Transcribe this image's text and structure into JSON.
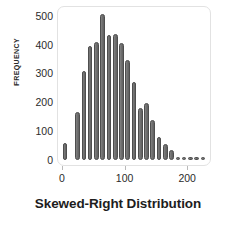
{
  "chart": {
    "type": "histogram",
    "title": "",
    "xlabel": "Skewed-Right Distribution",
    "ylabel": "Frequency",
    "ylabel_display": "FREQUENCY",
    "bar_color": "#6f6f6f",
    "bar_edge_color": "#4e4e4e",
    "frame_color": "#e2e2e2",
    "background": "#ffffff",
    "grid": false,
    "legend": null
  },
  "chart_data": {
    "type": "bar",
    "title": "",
    "xlabel": "Skewed-Right Distribution",
    "ylabel": "Frequency",
    "xlim": [
      -8,
      238
    ],
    "ylim": [
      0,
      520
    ],
    "grid": false,
    "legend_position": "none",
    "xticks": [
      0,
      100,
      200
    ],
    "xtick_labels": [
      "0",
      "100",
      "200"
    ],
    "yticks": [
      0,
      100,
      200,
      300,
      400,
      500
    ],
    "ytick_labels": [
      "0",
      "100",
      "200",
      "300",
      "400",
      "500"
    ],
    "bin_width": 10,
    "categories": [
      "5",
      "15",
      "25",
      "35",
      "45",
      "55",
      "65",
      "75",
      "85",
      "95",
      "105",
      "115",
      "125",
      "135",
      "145",
      "155",
      "165",
      "175",
      "185",
      "195",
      "205",
      "215",
      "225"
    ],
    "x": [
      5,
      15,
      25,
      35,
      45,
      55,
      65,
      75,
      85,
      95,
      105,
      115,
      125,
      135,
      145,
      155,
      165,
      175,
      185,
      195,
      205,
      215,
      225
    ],
    "values": [
      60,
      0,
      168,
      310,
      395,
      410,
      505,
      435,
      438,
      405,
      348,
      272,
      182,
      196,
      140,
      80,
      55,
      33,
      10,
      7,
      6,
      6,
      6
    ]
  }
}
